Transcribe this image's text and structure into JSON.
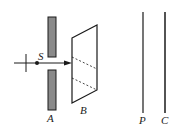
{
  "diagram": {
    "type": "optics-apparatus",
    "labels": {
      "source": "S",
      "slit_plate": "A",
      "prism": "B",
      "screen_p": "P",
      "screen_c": "C"
    },
    "colors": {
      "line": "#1a1a1a",
      "plate_fill": "#8a8a8a",
      "background": "#ffffff"
    }
  }
}
